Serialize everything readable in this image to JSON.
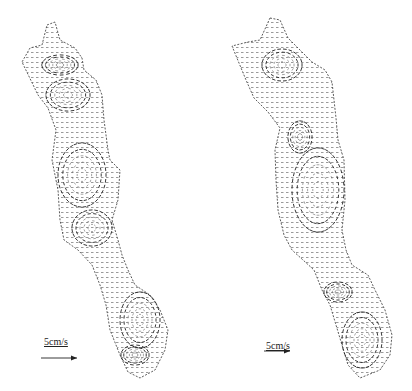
{
  "figure": {
    "panels": [
      {
        "id": "left",
        "scale_label": "5cm/s",
        "scale_bar_px": 36,
        "vortices": [
          {
            "cx": 60,
            "cy": 65,
            "rx": 18,
            "ry": 10,
            "dir": "cw"
          },
          {
            "cx": 68,
            "cy": 95,
            "rx": 22,
            "ry": 16,
            "dir": "ccw"
          },
          {
            "cx": 82,
            "cy": 175,
            "rx": 24,
            "ry": 32,
            "dir": "cw"
          },
          {
            "cx": 92,
            "cy": 228,
            "rx": 20,
            "ry": 18,
            "dir": "ccw"
          },
          {
            "cx": 140,
            "cy": 320,
            "rx": 20,
            "ry": 28,
            "dir": "cw"
          },
          {
            "cx": 135,
            "cy": 355,
            "rx": 14,
            "ry": 10,
            "dir": "ccw"
          }
        ]
      },
      {
        "id": "right",
        "scale_label": "5cm/s",
        "scale_bar_px": 26,
        "vortices": [
          {
            "cx": 282,
            "cy": 65,
            "rx": 20,
            "ry": 16,
            "dir": "cw"
          },
          {
            "cx": 300,
            "cy": 137,
            "rx": 12,
            "ry": 16,
            "dir": "ccw"
          },
          {
            "cx": 318,
            "cy": 190,
            "rx": 26,
            "ry": 42,
            "dir": "cw"
          },
          {
            "cx": 338,
            "cy": 292,
            "rx": 14,
            "ry": 10,
            "dir": "ccw"
          },
          {
            "cx": 362,
            "cy": 340,
            "rx": 20,
            "ry": 28,
            "dir": "cw"
          }
        ]
      }
    ]
  }
}
